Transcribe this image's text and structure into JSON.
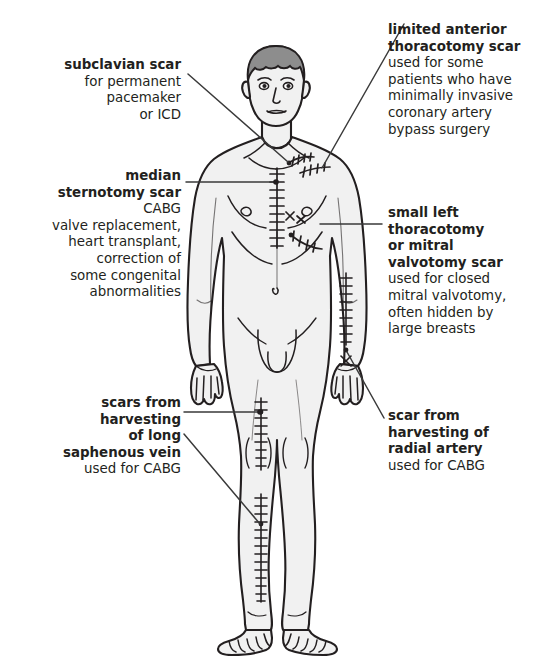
{
  "diagram": {
    "colors": {
      "ink": "#231f20",
      "skin_fill": "#f1f1f1",
      "hair_fill": "#8d8d8d",
      "leader_line": "#3a3a3a",
      "background": "#ffffff"
    }
  },
  "labels": {
    "subclavian": {
      "heading": "subclavian scar",
      "lines": [
        "for permanent",
        "pacemaker",
        "or ICD"
      ],
      "side": "left"
    },
    "sternotomy": {
      "heading_line1": "median",
      "heading_line2": "sternotomy scar",
      "lines": [
        "CABG",
        "valve replacement,",
        "heart transplant,",
        "correction of",
        "some congenital",
        "abnormalities"
      ],
      "side": "left"
    },
    "saphenous": {
      "heading_line1": "scars from",
      "heading_line2": "harvesting",
      "heading_line3": "of long",
      "heading_line4": "saphenous vein",
      "lines": [
        "used for CABG"
      ],
      "side": "left"
    },
    "thoracotomy": {
      "heading_line1": "limited anterior",
      "heading_line2": "thoracotomy scar",
      "lines": [
        "used for some",
        "patients who have",
        "minimally invasive",
        "coronary artery",
        "bypass surgery"
      ],
      "side": "right"
    },
    "mitral": {
      "heading_line1": "small left",
      "heading_line2": "thoracotomy",
      "heading_line3": "or mitral",
      "heading_line4": "valvotomy scar",
      "lines": [
        "used for closed",
        "mitral valvotomy,",
        "often hidden by",
        "large breasts"
      ],
      "side": "right"
    },
    "radial": {
      "heading_line1": "scar from",
      "heading_line2": "harvesting of",
      "heading_line3": "radial artery",
      "lines": [
        "used for CABG"
      ],
      "side": "right"
    }
  },
  "scars": [
    {
      "name": "subclavian-scar",
      "location": "right infraclavicular region",
      "style": "sutured-line"
    },
    {
      "name": "median-sternotomy-scar",
      "location": "midline sternum",
      "style": "ladder-sutures"
    },
    {
      "name": "limited-anterior-thoracotomy-scar",
      "location": "left upper chest",
      "style": "sutured-line"
    },
    {
      "name": "small-left-thoracotomy-scar",
      "location": "left sub-mammary",
      "style": "sutured-line"
    },
    {
      "name": "radial-artery-harvest-scar",
      "location": "left forearm",
      "style": "ladder-sutures"
    },
    {
      "name": "long-saphenous-vein-thigh-scar",
      "location": "right thigh",
      "style": "ladder-sutures"
    },
    {
      "name": "long-saphenous-vein-calf-scar",
      "location": "right lower leg",
      "style": "ladder-sutures"
    }
  ]
}
